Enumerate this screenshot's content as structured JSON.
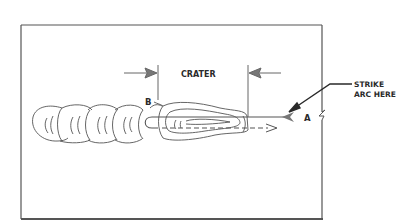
{
  "figure": {
    "labels": {
      "crater": "CRATER",
      "strike_line1": "STRIKE",
      "strike_line2": "ARC HERE",
      "point_a": "A",
      "point_b": "B"
    },
    "colors": {
      "line": "#4a4a4a",
      "text": "#2a2a2a",
      "background": "#ffffff"
    }
  }
}
